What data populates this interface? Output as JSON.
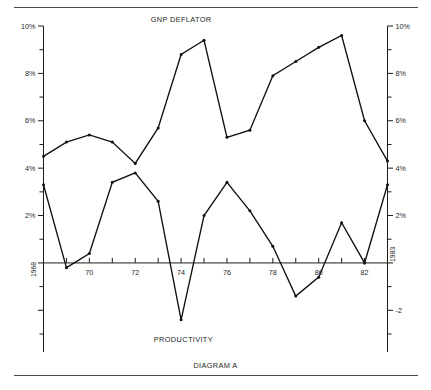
{
  "chart_data": {
    "type": "line",
    "title": "DIAGRAM A",
    "xlabel": "",
    "ylabel": "",
    "grid": false,
    "legend_position": "inline-annotation",
    "xlim": [
      1968,
      1983
    ],
    "ylim": [
      -3,
      10
    ],
    "x": [
      1968,
      1969,
      1970,
      1971,
      1972,
      1973,
      1974,
      1975,
      1976,
      1977,
      1978,
      1979,
      1980,
      1981,
      1982,
      1983
    ],
    "xtick_values": [
      1968,
      1969,
      1970,
      1971,
      1972,
      1973,
      1974,
      1975,
      1976,
      1977,
      1978,
      1979,
      1980,
      1981,
      1982,
      1983
    ],
    "xtick_labels": [
      "1968",
      "",
      "70",
      "",
      "72",
      "",
      "74",
      "",
      "76",
      "",
      "78",
      "",
      "80",
      "",
      "82",
      "1983"
    ],
    "ytick_major_values": [
      10,
      8,
      6,
      4,
      2,
      0,
      -2
    ],
    "ytick_major_labels_left": [
      "10%",
      "8%",
      "6%",
      "4%",
      "2%",
      "",
      ""
    ],
    "ytick_major_labels_right": [
      "10%",
      "8%",
      "6%",
      "4%",
      "2%",
      "",
      "-2"
    ],
    "ytick_minor_values": [
      9,
      7,
      5,
      3,
      1,
      -1,
      -3
    ],
    "series": [
      {
        "name": "GNP DEFLATOR",
        "values": [
          4.5,
          5.1,
          5.4,
          5.1,
          4.2,
          5.7,
          8.8,
          9.4,
          5.3,
          5.6,
          7.9,
          8.5,
          9.1,
          9.6,
          6.0,
          4.3
        ]
      },
      {
        "name": "PRODUCTIVITY",
        "values": [
          3.3,
          -0.2,
          0.4,
          3.4,
          3.8,
          2.6,
          -2.4,
          2.0,
          3.4,
          2.2,
          0.7,
          -1.4,
          -0.6,
          1.7,
          0.0,
          3.3
        ]
      }
    ],
    "annotations": [
      {
        "text": "GNP DEFLATOR",
        "x": 1974.0,
        "y": 10.15,
        "name": "gnp-deflator-caption"
      },
      {
        "text": "PRODUCTIVITY",
        "x": 1974.1,
        "y": -3.35,
        "name": "productivity-caption"
      }
    ],
    "axis_edge_labels": {
      "left_start_year": "1968",
      "right_end_year": "1983"
    }
  },
  "figure": {
    "caption": "DIAGRAM A"
  }
}
